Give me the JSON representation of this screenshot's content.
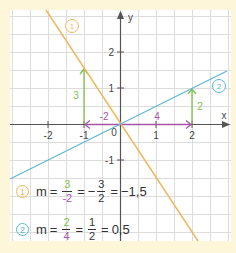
{
  "colors": {
    "background": "#fdf6d8",
    "grid_bg": "#ffffff",
    "grid_line": "#d9d9d9",
    "axis": "#555555",
    "line1": "#f0b65a",
    "line2": "#5bb8cf",
    "rise": "#7cc24a",
    "run": "#a855a8",
    "text": "#333333"
  },
  "chart_data": {
    "type": "line",
    "title": "",
    "xlabel": "x",
    "ylabel": "y",
    "x_ticks": [
      "-2",
      "-1",
      "0",
      "1",
      "2"
    ],
    "y_ticks": [
      "2",
      "1",
      "-1"
    ],
    "origin_label": "0",
    "grid": true,
    "xlim": [
      -3.05,
      3.08
    ],
    "ylim": [
      -3.25,
      3.17
    ],
    "series": [
      {
        "name": "1",
        "slope": -1.5,
        "intercept": 0,
        "points": [
          [
            -2.11,
            3.17
          ],
          [
            2.17,
            -3.25
          ]
        ],
        "color": "#f0b65a",
        "slope_triangle": {
          "from": [
            0,
            0
          ],
          "run": -2,
          "rise": 3,
          "run_label": "-2",
          "rise_label": "3"
        }
      },
      {
        "name": "2",
        "slope": 0.5,
        "intercept": 0,
        "points": [
          [
            -3.05,
            -1.53
          ],
          [
            2.92,
            1.46
          ]
        ],
        "color": "#5bb8cf",
        "slope_triangle": {
          "from": [
            0,
            0
          ],
          "run": 4,
          "rise": 2,
          "run_label": "4",
          "rise_label": "2"
        }
      }
    ]
  },
  "labels": {
    "axis_x": "x",
    "axis_y": "y",
    "tick_x_m2": "-2",
    "tick_x_m1": "-1",
    "tick_x_0": "0",
    "tick_x_1": "1",
    "tick_x_2": "2",
    "tick_y_2": "2",
    "tick_y_1": "1",
    "tick_y_m1": "-1",
    "line1_badge": "1",
    "line2_badge": "2",
    "rise1": "3",
    "run1": "-2",
    "rise2": "2",
    "run2": "4"
  },
  "formulas": [
    {
      "badge": "1",
      "m": "m",
      "eq": "=",
      "f1_num": "3",
      "f1_den": "-2",
      "minus": "−",
      "f2_num": "3",
      "f2_den": "2",
      "result": "−1,5"
    },
    {
      "badge": "2",
      "m": "m",
      "eq": "=",
      "f1_num": "2",
      "f1_den": "4",
      "f2_num": "1",
      "f2_den": "2",
      "result": "0,5"
    }
  ]
}
